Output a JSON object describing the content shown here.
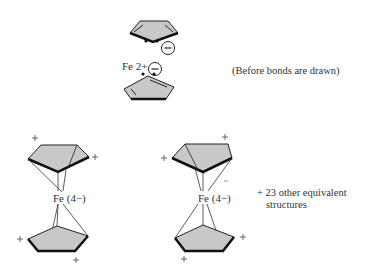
{
  "top_structure": {
    "metal_label": "Fe 2+",
    "ring_charge": "−",
    "caption": "(Before bonds are drawn)"
  },
  "bottom_structures": [
    {
      "metal_label": "Fe (4−)",
      "ring_charges": [
        "+",
        "+",
        "+",
        "+"
      ]
    },
    {
      "metal_label": "Fe (4−)",
      "ring_charges": [
        "+",
        "+",
        "+",
        "+"
      ],
      "extra_charge": "−"
    }
  ],
  "caption_bottom": {
    "line1": "+ 23 other equivalent",
    "line2": "structures"
  },
  "colors": {
    "ring_fill": "#c8c8c8",
    "line": "#222222",
    "text": "#333333"
  }
}
